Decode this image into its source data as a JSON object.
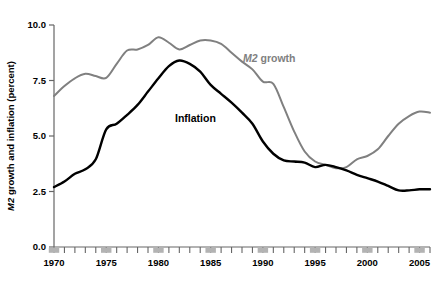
{
  "chart_data": {
    "type": "line",
    "title": "",
    "xlabel": "",
    "ylabel": "M2 growth and inflation (percent)",
    "ylabel_italic_prefix": "M2",
    "ylabel_rest": " growth and inflation (percent)",
    "ylim": [
      0.0,
      10.0
    ],
    "xlim": [
      1970,
      2006
    ],
    "grid": false,
    "legend_position": "inline-annotation",
    "y_ticks": [
      "0.0",
      "2.5",
      "5.0",
      "7.5",
      "10.0"
    ],
    "y_tick_values": [
      0.0,
      2.5,
      5.0,
      7.5,
      10.0
    ],
    "x_ticks": [
      "1970",
      "1975",
      "1980",
      "1985",
      "1990",
      "1995",
      "2000",
      "2005"
    ],
    "x_tick_values": [
      1970,
      1975,
      1980,
      1985,
      1990,
      1995,
      2000,
      2005
    ],
    "x_minor_tick_interval": 1,
    "x_marker_years": [
      1970,
      1975,
      1980,
      1985,
      1990,
      1995,
      2000,
      2005
    ],
    "x_marker_color": "#b3b3b3",
    "x": [
      1970,
      1971,
      1972,
      1973,
      1974,
      1975,
      1976,
      1977,
      1978,
      1979,
      1980,
      1981,
      1982,
      1983,
      1984,
      1985,
      1986,
      1987,
      1988,
      1989,
      1990,
      1991,
      1992,
      1993,
      1994,
      1995,
      1996,
      1997,
      1998,
      1999,
      2000,
      2001,
      2002,
      2003,
      2004,
      2005,
      2006
    ],
    "series": [
      {
        "name": "M2 growth",
        "name_italic_prefix": "M2",
        "name_rest": " growth",
        "color": "#808080",
        "line_width": 2.0,
        "values": [
          6.8,
          7.25,
          7.6,
          7.8,
          7.7,
          7.62,
          8.25,
          8.85,
          8.9,
          9.1,
          9.45,
          9.2,
          8.9,
          9.1,
          9.3,
          9.3,
          9.15,
          8.75,
          8.35,
          8.0,
          7.45,
          7.35,
          6.3,
          5.2,
          4.3,
          3.85,
          3.7,
          3.55,
          3.6,
          3.95,
          4.1,
          4.4,
          5.0,
          5.55,
          5.9,
          6.1,
          6.05
        ]
      },
      {
        "name": "Inflation",
        "color": "#000000",
        "line_width": 2.4,
        "values": [
          2.7,
          2.95,
          3.3,
          3.5,
          3.95,
          5.3,
          5.55,
          5.95,
          6.4,
          7.0,
          7.6,
          8.15,
          8.4,
          8.25,
          7.9,
          7.3,
          6.9,
          6.5,
          6.05,
          5.55,
          4.75,
          4.2,
          3.9,
          3.85,
          3.8,
          3.6,
          3.7,
          3.6,
          3.45,
          3.25,
          3.1,
          2.95,
          2.75,
          2.55,
          2.55,
          2.6,
          2.6
        ]
      }
    ],
    "annotations": [
      {
        "name": "m2-growth-label",
        "text": "M2 growth",
        "italic_prefix": "M2",
        "rest": " growth",
        "color": "#808080",
        "x_px": 243,
        "y_px": 62
      },
      {
        "name": "inflation-label",
        "text": "Inflation",
        "color": "#000000",
        "x_px": 175,
        "y_px": 122
      }
    ]
  },
  "plot_geometry": {
    "left_px": 54,
    "right_px": 430,
    "top_px": 25,
    "bottom_px": 247,
    "axis_color": "#666666"
  }
}
